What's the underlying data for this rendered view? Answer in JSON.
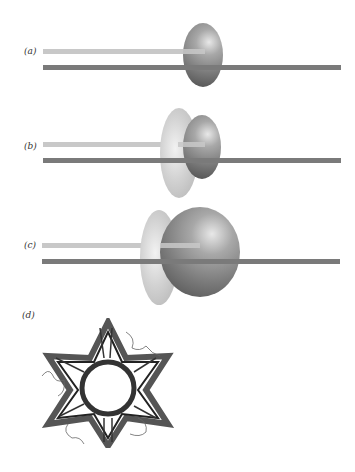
{
  "panels": [
    {
      "id": "a",
      "label": "(a)"
    },
    {
      "id": "b",
      "label": "(b)"
    },
    {
      "id": "c",
      "label": "(c)"
    },
    {
      "id": "d",
      "label": "(d)"
    }
  ],
  "colors": {
    "template_strand": "#c8c8c8",
    "primer_strand": "#7a7a7a",
    "polymerase": "#7a7a7a",
    "clamp": "#d2d2d2"
  }
}
